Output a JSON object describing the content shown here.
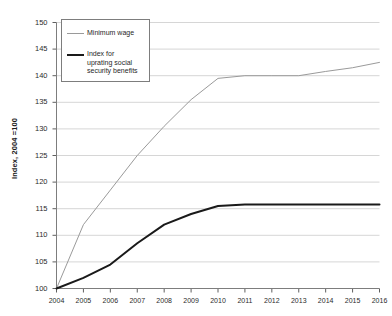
{
  "chart_data": {
    "type": "line",
    "title": "",
    "xlabel": "",
    "ylabel": "Index, 2004 =100",
    "x": [
      2004,
      2005,
      2006,
      2007,
      2008,
      2009,
      2010,
      2011,
      2012,
      2013,
      2014,
      2015,
      2016
    ],
    "xtick_labels": [
      "2004",
      "2005",
      "2006",
      "2007",
      "2008",
      "2009",
      "2010",
      "2011",
      "2012",
      "2013",
      "2014",
      "2015",
      "2016"
    ],
    "ylim": [
      100,
      150
    ],
    "ytick_labels": [
      "100",
      "105",
      "110",
      "115",
      "120",
      "125",
      "130",
      "135",
      "140",
      "145",
      "150"
    ],
    "yticks": [
      100,
      105,
      110,
      115,
      120,
      125,
      130,
      135,
      140,
      145,
      150
    ],
    "xlim": [
      2004,
      2016
    ],
    "grid": "horizontal",
    "legend_position": "top-left-inside",
    "series": [
      {
        "name": "Minimum wage",
        "color": "#9a9a9a",
        "width": 1,
        "values": [
          100,
          112,
          118.5,
          125,
          130.5,
          135.5,
          139.5,
          140,
          140,
          140,
          140.8,
          141.5,
          142.5
        ]
      },
      {
        "name": "Index for uprating social\nsecurity benefits",
        "color": "#1a1a1a",
        "width": 2,
        "values": [
          100,
          102,
          104.5,
          108.5,
          112,
          114,
          115.5,
          115.8,
          115.8,
          115.8,
          115.8,
          115.8,
          115.8
        ]
      }
    ]
  },
  "legend": {
    "items": [
      {
        "label": "Minimum wage"
      },
      {
        "label": "Index for\nuprating social\nsecurity benefits"
      }
    ]
  }
}
